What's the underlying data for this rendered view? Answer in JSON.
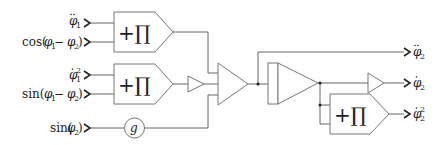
{
  "diagram": {
    "title": "",
    "inputs": [
      {
        "id": "in1",
        "label": "φ̈₁",
        "base": "φ",
        "accent": "double-dot",
        "subscript": "1",
        "superscript": ""
      },
      {
        "id": "in2",
        "label": "cos(φ₁ − φ₂)",
        "prefix": "cos(",
        "base1": "φ",
        "sub1": "1",
        "minus": " − ",
        "base2": "φ",
        "sub2": "2",
        "suffix": ")"
      },
      {
        "id": "in3",
        "label": "φ̇₁²",
        "base": "φ",
        "accent": "dot",
        "subscript": "1",
        "superscript": "2"
      },
      {
        "id": "in4",
        "label": "sin(φ₁ − φ₂)",
        "prefix": "sin(",
        "base1": "φ",
        "sub1": "1",
        "minus": " − ",
        "base2": "φ",
        "sub2": "2",
        "suffix": ")"
      },
      {
        "id": "in5",
        "label": "sin(φ₂)",
        "prefix": "sin(",
        "base1": "φ",
        "sub1": "2",
        "suffix": ")"
      }
    ],
    "outputs": [
      {
        "id": "out1",
        "label": "φ̈₂",
        "base": "φ",
        "accent": "double-dot",
        "subscript": "2",
        "superscript": ""
      },
      {
        "id": "out2",
        "label": "φ̇₂",
        "base": "φ",
        "accent": "dot",
        "subscript": "2",
        "superscript": ""
      },
      {
        "id": "out3",
        "label": "φ̇₂²",
        "base": "φ",
        "accent": "dot",
        "subscript": "2",
        "superscript": "2"
      }
    ],
    "blocks": [
      {
        "id": "mult1",
        "type": "multiplier",
        "symbol": "+∏"
      },
      {
        "id": "mult2",
        "type": "multiplier",
        "symbol": "+∏"
      },
      {
        "id": "gain1",
        "type": "gain",
        "symbol": ""
      },
      {
        "id": "const_g",
        "type": "coefficient",
        "symbol": "g"
      },
      {
        "id": "sum1",
        "type": "summer",
        "symbol": ""
      },
      {
        "id": "int1",
        "type": "integrator",
        "symbol": ""
      },
      {
        "id": "int2",
        "type": "integrator",
        "symbol": ""
      },
      {
        "id": "mult3",
        "type": "multiplier",
        "symbol": "+∏"
      }
    ]
  }
}
